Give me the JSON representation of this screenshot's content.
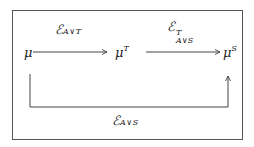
{
  "diagram": {
    "nodes": [
      {
        "id": "mu",
        "base": "μ",
        "sup": ""
      },
      {
        "id": "muT",
        "base": "μ",
        "sup": "T"
      },
      {
        "id": "muS",
        "base": "μ",
        "sup": "S"
      }
    ],
    "edges": [
      {
        "from": "mu",
        "to": "muT",
        "label": {
          "base": "ℰ",
          "sub": "A∨T",
          "sup": ""
        }
      },
      {
        "from": "muT",
        "to": "muS",
        "label": {
          "base": "ℰ",
          "sub": "A∨S",
          "sup": "T"
        }
      },
      {
        "from": "mu",
        "to": "muS",
        "label": {
          "base": "ℰ",
          "sub": "A∨S",
          "sup": ""
        },
        "route": "below"
      }
    ]
  }
}
